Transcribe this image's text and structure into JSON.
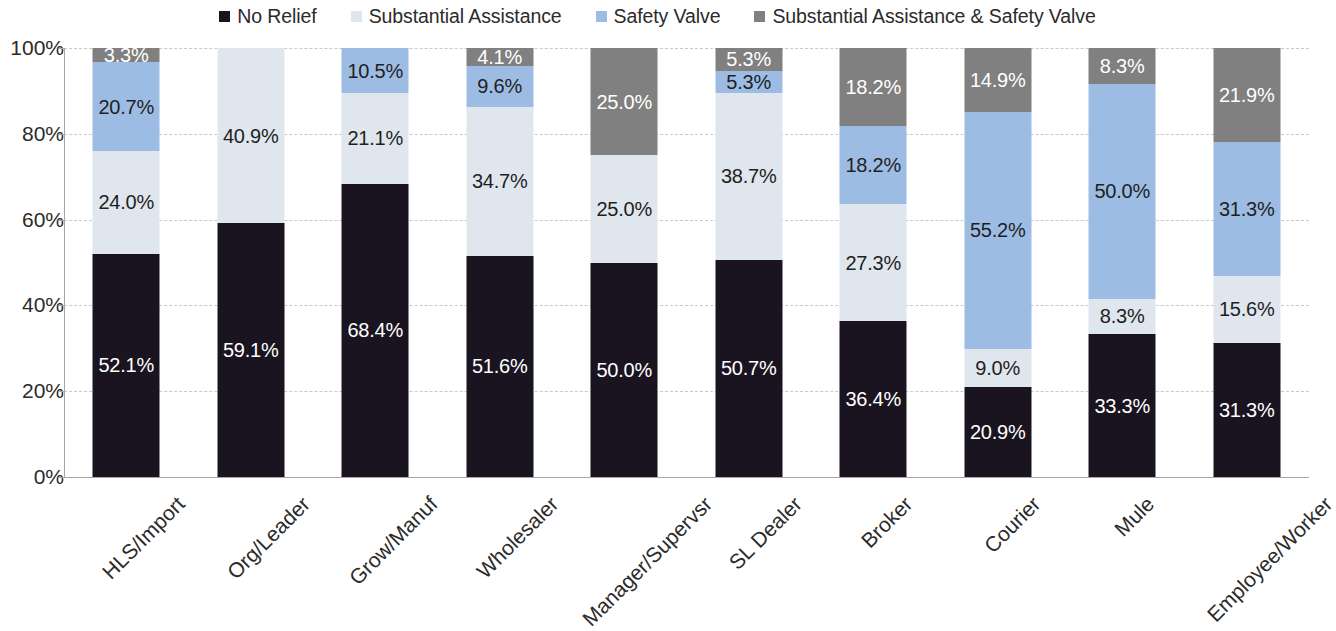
{
  "legend": {
    "items": [
      {
        "label": "No Relief",
        "color": "#1a1420"
      },
      {
        "label": "Substantial Assistance",
        "color": "#dfe6ed"
      },
      {
        "label": "Safety Valve",
        "color": "#9dbce3"
      },
      {
        "label": "Substantial Assistance & Safety Valve",
        "color": "#808080"
      }
    ]
  },
  "axis": {
    "y_ticks": [
      "0%",
      "20%",
      "40%",
      "60%",
      "80%",
      "100%"
    ]
  },
  "chart_data": {
    "type": "bar",
    "stacked": true,
    "stack_mode": "percent",
    "title": "",
    "xlabel": "",
    "ylabel": "",
    "ylim": [
      0,
      100
    ],
    "grid": true,
    "legend_position": "top",
    "categories": [
      "HLS/Import",
      "Org/Leader",
      "Grow/Manuf",
      "Wholesaler",
      "Manager/Supervsr",
      "SL Dealer",
      "Broker",
      "Courier",
      "Mule",
      "Employee/Worker"
    ],
    "series": [
      {
        "name": "No Relief",
        "color": "#1a1420",
        "values": [
          52.1,
          59.1,
          68.4,
          51.6,
          50.0,
          50.7,
          36.4,
          20.9,
          33.3,
          31.3
        ],
        "labels": [
          "52.1%",
          "59.1%",
          "68.4%",
          "51.6%",
          "50.0%",
          "50.7%",
          "36.4%",
          "20.9%",
          "33.3%",
          "31.3%"
        ]
      },
      {
        "name": "Substantial Assistance",
        "color": "#dfe6ed",
        "values": [
          24.0,
          40.9,
          21.1,
          34.7,
          25.0,
          38.7,
          27.3,
          9.0,
          8.3,
          15.6
        ],
        "labels": [
          "24.0%",
          "40.9%",
          "21.1%",
          "34.7%",
          "25.0%",
          "38.7%",
          "27.3%",
          "9.0%",
          "8.3%",
          "15.6%"
        ]
      },
      {
        "name": "Safety Valve",
        "color": "#9dbce3",
        "values": [
          20.7,
          0,
          10.5,
          9.6,
          0,
          5.3,
          18.2,
          55.2,
          50.0,
          31.3
        ],
        "labels": [
          "20.7%",
          "",
          "10.5%",
          "9.6%",
          "",
          "5.3%",
          "18.2%",
          "55.2%",
          "50.0%",
          "31.3%"
        ]
      },
      {
        "name": "Substantial Assistance & Safety Valve",
        "color": "#808080",
        "values": [
          3.3,
          0,
          0,
          4.1,
          25.0,
          5.3,
          18.2,
          14.9,
          8.3,
          21.9
        ],
        "labels": [
          "3.3%",
          "",
          "",
          "4.1%",
          "25.0%",
          "5.3%",
          "18.2%",
          "14.9%",
          "8.3%",
          "21.9%"
        ]
      }
    ]
  }
}
